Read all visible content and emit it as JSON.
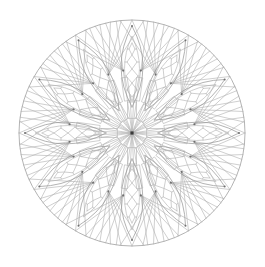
{
  "artwork": {
    "kind": "mandala-line-drawing",
    "description": "Twelve-fold symmetric mandala line art: outer circle, 12 lattice petals with diamond chains, crossing fan rays between petals, inner ring of slender spokes, dense starburst converging on a dark center dot",
    "background_color": "#ffffff",
    "line_color": "#aeaeae",
    "strong_line_color": "#9a9a9a",
    "node_dot_color": "#6f6f6f",
    "center_dot_color": "#3a3a3a",
    "line_width": 0.6,
    "strong_line_width": 0.75,
    "canvas": {
      "width": 265,
      "height": 267
    },
    "center": {
      "x": 132,
      "y": 133
    },
    "outer_circle_radius": 113,
    "symmetry_fold": 12,
    "petal": {
      "count": 12,
      "start_angle_deg": 90,
      "angle_step_deg": 30,
      "outer_vesica": {
        "base_radius": 26,
        "tip_radius": 107,
        "half_width": 11
      },
      "inner_vesica": {
        "base_radius": 32,
        "tip_radius": 97,
        "half_width": 7.5
      },
      "diamond_chain_radii": [
        36,
        50,
        64,
        78,
        90
      ],
      "diamond_half_widths": [
        5,
        6,
        5,
        3
      ],
      "tip_dot_radius": 1.0
    },
    "fan": {
      "apex_radius": 63,
      "apex_offset_deg": 8,
      "spread_offsets_deg": [
        0,
        5.5,
        11,
        16.5,
        22,
        28
      ],
      "outer_radius": 113,
      "apex_dot_radius": 1.1
    },
    "spokes": {
      "stem_inner_radius": 15,
      "stem_outer_radius": 31,
      "stem_half_width": 4.5,
      "ring_inner_radius": 33,
      "ring_outer_radius": 56,
      "ring_half_width": 3
    },
    "center_rays": {
      "petal_ray_offset_deg": 3,
      "petal_ray_radius": 38
    },
    "center_dot_size": 3.2
  }
}
